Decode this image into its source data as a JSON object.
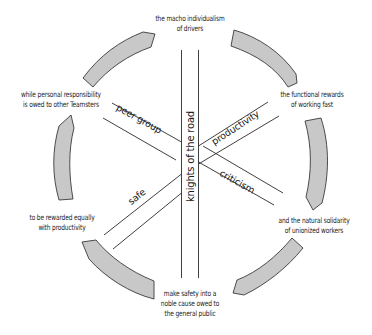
{
  "diagram": {
    "center_label": "knights of the road",
    "band_labels": {
      "upper_left": "peer group",
      "upper_right": "productivity",
      "lower_left": "safe",
      "lower_right": "criticism"
    },
    "ring_labels": {
      "top": [
        "the macho individualism",
        "of drivers"
      ],
      "upper_right": [
        "the functional rewards",
        "of working fast"
      ],
      "lower_right": [
        "and the natural solidarity",
        "of unionized workers"
      ],
      "bottom": [
        "make safety into a",
        "noble cause owed to",
        "the general public"
      ],
      "lower_left": [
        "to be rewarded equally",
        "with productivity"
      ],
      "upper_left": [
        "while personal responsibility",
        "is owed to other Teamsters"
      ]
    },
    "colors": {
      "arrow_fill": "#c8c8c8",
      "arrow_stroke": "#3a3a3a",
      "line": "#2a2a2a",
      "text": "#1a1a1a"
    }
  }
}
